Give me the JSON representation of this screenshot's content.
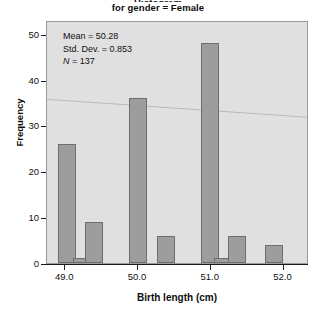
{
  "chart_data": {
    "type": "bar",
    "title": "Histogram",
    "subtitle": "for gender = Female",
    "xlabel": "Birth length (cm)",
    "ylabel": "Frequency",
    "xlim": [
      48.75,
      52.35
    ],
    "ylim": [
      0,
      53
    ],
    "grid": false,
    "legend": null,
    "x_ticks": [
      "49.0",
      "50.0",
      "51.0",
      "52.0"
    ],
    "x_tick_values": [
      49.0,
      50.0,
      51.0,
      52.0
    ],
    "y_ticks": [
      "0",
      "10",
      "20",
      "30",
      "40",
      "50"
    ],
    "y_tick_values": [
      0,
      10,
      20,
      30,
      40,
      50
    ],
    "bin_width": 0.25,
    "categories": [
      "49.00",
      "49.25",
      "49.50",
      "50.00",
      "50.25",
      "51.00",
      "51.25",
      "51.50",
      "52.00"
    ],
    "values": [
      26,
      1,
      9,
      36,
      6,
      48,
      1,
      6,
      4
    ],
    "bars": [
      {
        "label": "49.00",
        "center": 49.02,
        "value": 26
      },
      {
        "label": "49.25",
        "center": 49.23,
        "value": 1
      },
      {
        "label": "49.50",
        "center": 49.4,
        "value": 9
      },
      {
        "label": "50.00",
        "center": 50.0,
        "value": 36
      },
      {
        "label": "50.25",
        "center": 50.38,
        "value": 6
      },
      {
        "label": "51.00",
        "center": 50.99,
        "value": 48
      },
      {
        "label": "51.25",
        "center": 51.17,
        "value": 1
      },
      {
        "label": "51.50",
        "center": 51.36,
        "value": 6
      },
      {
        "label": "52.00",
        "center": 51.87,
        "value": 4
      }
    ],
    "annotations": {
      "mean_label": "Mean = 50.28",
      "stddev_label": "Std. Dev. = 0.853",
      "n_label": "N = 137",
      "n_symbol": "N",
      "n_value": " = 137",
      "mean": 50.28,
      "std_dev": 0.853,
      "n": 137
    },
    "colors": {
      "bar_fill": "#9d9d9d",
      "bar_edge": "#6e6e6e",
      "plot_background": "#e0e0e0",
      "plot_border": "#9a9a9a",
      "axis": "#1a1a1a",
      "text": "#111111"
    }
  }
}
